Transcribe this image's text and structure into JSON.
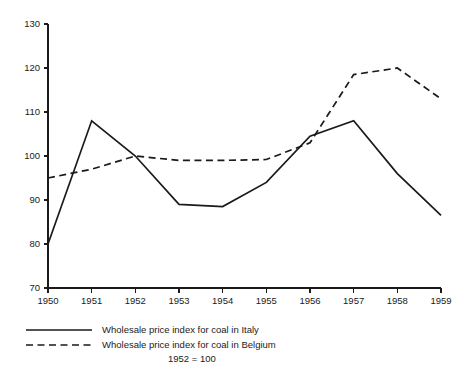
{
  "chart_data": {
    "type": "line",
    "title": "",
    "subtitle": "",
    "xlabel": "",
    "ylabel": "",
    "note": "1952 = 100",
    "x": [
      1950,
      1951,
      1952,
      1953,
      1954,
      1955,
      1956,
      1957,
      1958,
      1959
    ],
    "xtick_labels": [
      "1950",
      "1951",
      "1952",
      "1953",
      "1954",
      "1955",
      "1956",
      "1957",
      "1958",
      "1959"
    ],
    "ytick_labels": [
      "70",
      "80",
      "90",
      "100",
      "110",
      "120",
      "130"
    ],
    "yticks": [
      70,
      80,
      90,
      100,
      110,
      120,
      130
    ],
    "xlim": [
      1950,
      1959
    ],
    "ylim": [
      70,
      130
    ],
    "grid": false,
    "legend_position": "below",
    "series": [
      {
        "name": "Wholesale price index for coal in Italy",
        "style": "solid",
        "color": "#1a1a1a",
        "values": [
          80,
          108,
          100,
          89,
          88.5,
          94,
          104.5,
          108,
          96,
          86.5
        ]
      },
      {
        "name": "Wholesale price index for coal in Belgium",
        "style": "dashed",
        "color": "#1a1a1a",
        "values": [
          95,
          97,
          100,
          99,
          99,
          99.2,
          103,
          118.5,
          120,
          113
        ]
      }
    ]
  },
  "legend": {
    "items": [
      {
        "label": "Wholesale price index for coal in Italy",
        "style": "solid"
      },
      {
        "label": "Wholesale price index for coal in Belgium",
        "style": "dashed"
      }
    ],
    "note": "1952 = 100"
  }
}
